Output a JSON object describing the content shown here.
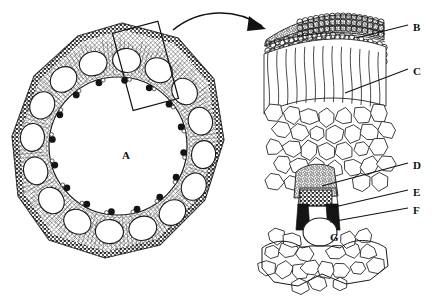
{
  "figure": {
    "background_color": "#ffffff",
    "ink_color": "#1a1a1a",
    "panels": [
      {
        "id": "overview",
        "name": "stem-cross-section-overview",
        "description": "Transverse section of a hollow stem showing a ring of vascular bundles, sclerenchyma band and a large central cavity"
      },
      {
        "id": "detail",
        "name": "magnified-detail-panel",
        "description": "Enlarged wedge of the stem wall showing epidermis, chlorenchyma, parenchyma and one vascular bundle"
      }
    ],
    "callout": {
      "name": "detail-selection-rectangle",
      "rotation_deg": -15,
      "arrow": "curved-arrow-to-detail"
    }
  },
  "labels": [
    {
      "key": "A",
      "text": "A",
      "x": 122,
      "y": 150,
      "target": "central-cavity",
      "leader": false
    },
    {
      "key": "B",
      "text": "B",
      "x": 413,
      "y": 22,
      "target": "epidermis",
      "leader": true,
      "line": {
        "x1": 356,
        "y1": 38,
        "x2": 408,
        "y2": 25
      }
    },
    {
      "key": "C",
      "text": "C",
      "x": 413,
      "y": 66,
      "target": "chlorenchyma-cortex",
      "leader": true,
      "line": {
        "x1": 345,
        "y1": 93,
        "x2": 408,
        "y2": 69
      }
    },
    {
      "key": "D",
      "text": "D",
      "x": 413,
      "y": 160,
      "target": "bundle-sheath",
      "leader": true,
      "line": {
        "x1": 322,
        "y1": 186,
        "x2": 408,
        "y2": 163
      }
    },
    {
      "key": "E",
      "text": "E",
      "x": 413,
      "y": 187,
      "target": "phloem",
      "leader": true,
      "line": {
        "x1": 330,
        "y1": 208,
        "x2": 408,
        "y2": 190
      }
    },
    {
      "key": "F",
      "text": "F",
      "x": 413,
      "y": 205,
      "target": "xylem",
      "leader": true,
      "line": {
        "x1": 330,
        "y1": 222,
        "x2": 408,
        "y2": 208
      }
    },
    {
      "key": "G",
      "text": "G",
      "x": 330,
      "y": 232,
      "target": "lacuna-air-space",
      "leader": false
    }
  ],
  "chart_data": {
    "type": "diagram",
    "annotations": [
      "A",
      "B",
      "C",
      "D",
      "E",
      "F",
      "G"
    ]
  }
}
